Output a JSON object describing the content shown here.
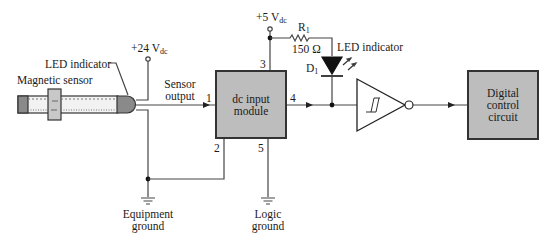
{
  "diagram": {
    "blocks": {
      "dc_input_module": {
        "line1": "dc input",
        "line2": "module"
      },
      "digital_control": {
        "line1": "Digital",
        "line2": "control",
        "line3": "circuit"
      }
    },
    "labels": {
      "magnetic_sensor": "Magnetic sensor",
      "led_indicator_sensor": "LED indicator",
      "supply_24": "+24 V",
      "supply_24_sub": "dc",
      "sensor_output_1": "Sensor",
      "sensor_output_2": "output",
      "supply_5": "+5 V",
      "supply_5_sub": "dc",
      "r1_name": "R",
      "r1_sub": "1",
      "r1_value": "150 Ω",
      "d1_name": "D",
      "d1_sub": "1",
      "led_indicator_d1": "LED indicator",
      "equipment_ground_1": "Equipment",
      "equipment_ground_2": "ground",
      "logic_ground_1": "Logic",
      "logic_ground_2": "ground"
    },
    "pins": {
      "pin1": "1",
      "pin2": "2",
      "pin3": "3",
      "pin4": "4",
      "pin5": "5"
    },
    "colors": {
      "block_fill": "#bdbdbd",
      "block_border": "#333333",
      "wire": "#444444",
      "diode_fill": "#111111"
    }
  }
}
